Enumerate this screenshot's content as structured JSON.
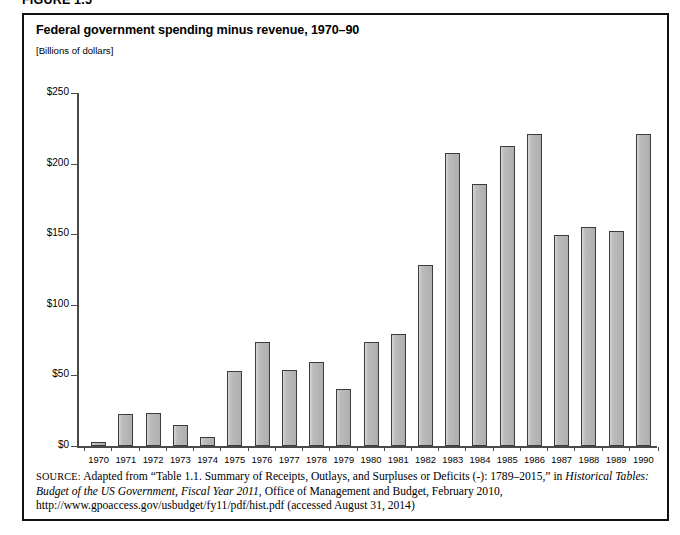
{
  "figure": {
    "number_label": "FIGURE 1.5"
  },
  "chart_title": "Federal government spending minus revenue, 1970–90",
  "chart_units": "[Billions of dollars]",
  "source_note": {
    "prefix": "SOURCE:",
    "part1": " Adapted from “Table 1.1. Summary of Receipts, Outlays, and Surpluses or Deficits (-): 1789–2015,” in ",
    "italic1": "Historical Tables: Budget of the US Government, Fiscal Year 2011",
    "part2": ", Office of Management and Budget, February 2010, http://www.gpoaccess.gov/usbudget/fy11/pdf/hist.pdf (accessed August 31, 2014)"
  },
  "chart_data": {
    "type": "bar",
    "title": "Federal government spending minus revenue, 1970–90",
    "subtitle": "[Billions of dollars]",
    "xlabel": "",
    "ylabel": "Billions of dollars",
    "ylim": [
      0,
      250
    ],
    "ytick_labels": [
      "$0",
      "$50",
      "$100",
      "$150",
      "$200",
      "$250"
    ],
    "ytick_values": [
      0,
      50,
      100,
      150,
      200,
      250
    ],
    "grid": false,
    "legend": false,
    "bar_color": "#b4b4b4",
    "bar_edge_color": "#3c3c3c",
    "categories": [
      "1970",
      "1971",
      "1972",
      "1973",
      "1974",
      "1975",
      "1976",
      "1977",
      "1978",
      "1979",
      "1980",
      "1981",
      "1982",
      "1983",
      "1984",
      "1985",
      "1986",
      "1987",
      "1988",
      "1989",
      "1990"
    ],
    "values": [
      2.8,
      23.0,
      23.4,
      14.9,
      6.1,
      53.2,
      73.7,
      53.7,
      59.2,
      40.7,
      73.8,
      79.0,
      128.0,
      207.8,
      185.4,
      212.3,
      221.2,
      149.7,
      155.2,
      152.6,
      221.0
    ]
  }
}
